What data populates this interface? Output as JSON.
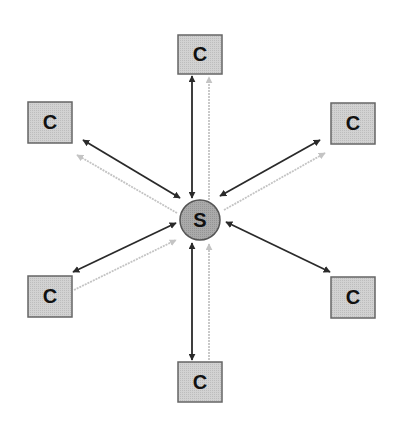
{
  "diagram": {
    "type": "star-topology",
    "server": {
      "label": "S",
      "cx": 200,
      "cy": 220,
      "r": 20,
      "fill": "#a8a8a8",
      "stroke": "#555555"
    },
    "clients": [
      {
        "id": "top",
        "label": "C",
        "x": 178,
        "y": 35,
        "w": 44,
        "h": 39
      },
      {
        "id": "top-left",
        "label": "C",
        "x": 28,
        "y": 102,
        "w": 44,
        "h": 41
      },
      {
        "id": "top-right",
        "label": "C",
        "x": 331,
        "y": 103,
        "w": 44,
        "h": 41
      },
      {
        "id": "bottom-left",
        "label": "C",
        "x": 28,
        "y": 276,
        "w": 44,
        "h": 41
      },
      {
        "id": "bottom-right",
        "label": "C",
        "x": 331,
        "y": 277,
        "w": 44,
        "h": 41
      },
      {
        "id": "bottom",
        "label": "C",
        "x": 178,
        "y": 362,
        "w": 44,
        "h": 40
      }
    ],
    "client_style": {
      "fill": "#cfcfcf",
      "stroke": "#666666"
    },
    "connections": {
      "dark_bidirectional_color": "#2a2a2a",
      "light_unidirectional_color": "#c4c4c4",
      "edges": [
        {
          "client": "top",
          "dark": "bidirectional",
          "light": "to-client"
        },
        {
          "client": "top-left",
          "dark": "bidirectional",
          "light": "to-client"
        },
        {
          "client": "top-right",
          "dark": "bidirectional",
          "light": "to-client"
        },
        {
          "client": "bottom-left",
          "dark": "bidirectional",
          "light": "to-server"
        },
        {
          "client": "bottom-right",
          "dark": "bidirectional",
          "light": "none"
        },
        {
          "client": "bottom",
          "dark": "bidirectional",
          "light": "to-server"
        }
      ]
    }
  }
}
